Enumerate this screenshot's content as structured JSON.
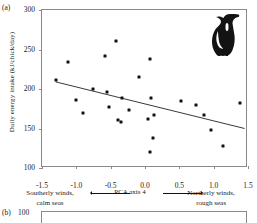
{
  "figure": {
    "panel_a_tag": "(a)",
    "panel_b_tag": "(b)"
  },
  "chart_data": {
    "type": "scatter",
    "title": "",
    "xlabel": "PCA axis 4",
    "ylabel": "Daily energy intake (kJ/chick/day)",
    "xlim": [
      -1.5,
      1.5
    ],
    "ylim": [
      100,
      300
    ],
    "xticks": [
      "-1.5",
      "-1.0",
      "-0.5",
      "0.0",
      "0.5",
      "1.0",
      "1.5"
    ],
    "xtick_values": [
      -1.5,
      -1.0,
      -0.5,
      0.0,
      0.5,
      1.0,
      1.5
    ],
    "yticks": [
      "100",
      "150",
      "200",
      "250",
      "300"
    ],
    "ytick_values": [
      100,
      150,
      200,
      250,
      300
    ],
    "grid": false,
    "legend": "none",
    "x_axis_annotation_left": "Southerly winds, calm seas",
    "x_axis_annotation_right": "Northerly winds, rough seas",
    "x_axis_annotation_left_line1": "Southerly winds,",
    "x_axis_annotation_left_line2": "calm seas",
    "x_axis_annotation_right_line1": "Northerly winds,",
    "x_axis_annotation_right_line2": "rough seas",
    "marker": "filled-square",
    "marker_color": "#111111",
    "points": [
      {
        "x": -1.3,
        "y": 211
      },
      {
        "x": -1.12,
        "y": 234
      },
      {
        "x": -1.0,
        "y": 186
      },
      {
        "x": -0.9,
        "y": 170
      },
      {
        "x": -0.76,
        "y": 200
      },
      {
        "x": -0.58,
        "y": 242
      },
      {
        "x": -0.55,
        "y": 196
      },
      {
        "x": -0.53,
        "y": 177
      },
      {
        "x": -0.42,
        "y": 261
      },
      {
        "x": -0.4,
        "y": 161
      },
      {
        "x": -0.35,
        "y": 158
      },
      {
        "x": -0.33,
        "y": 188
      },
      {
        "x": -0.24,
        "y": 174
      },
      {
        "x": -0.09,
        "y": 215
      },
      {
        "x": 0.05,
        "y": 162
      },
      {
        "x": 0.07,
        "y": 238
      },
      {
        "x": 0.07,
        "y": 120
      },
      {
        "x": 0.09,
        "y": 188
      },
      {
        "x": 0.11,
        "y": 138
      },
      {
        "x": 0.13,
        "y": 167
      },
      {
        "x": 0.53,
        "y": 185
      },
      {
        "x": 0.74,
        "y": 180
      },
      {
        "x": 0.86,
        "y": 167
      },
      {
        "x": 0.96,
        "y": 148
      },
      {
        "x": 1.14,
        "y": 128
      },
      {
        "x": 1.38,
        "y": 182
      }
    ],
    "regression_line": {
      "x_start": -1.3,
      "y_start": 209,
      "x_end": 1.45,
      "y_end": 150,
      "color": "#222222"
    },
    "icon": "guillemot-bird-silhouette",
    "panel_b": {
      "ytick_top": "100"
    }
  }
}
